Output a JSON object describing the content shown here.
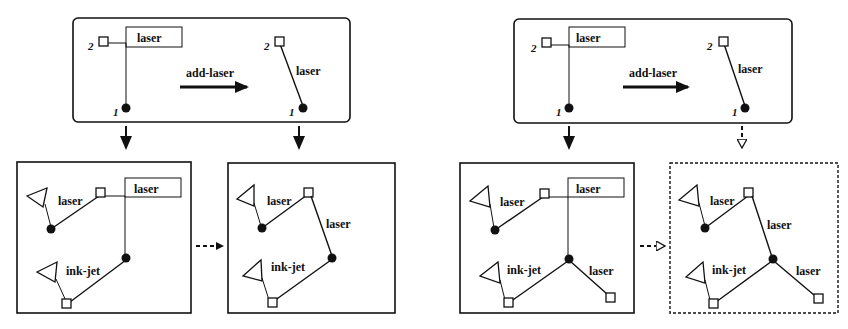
{
  "diagram": {
    "type": "graph-rewriting-rule-application",
    "panels": [
      {
        "id": "rule-left",
        "kind": "rule",
        "frame": "solid-rounded",
        "rule_label": "add-laser",
        "lhs": {
          "node_labels": [
            "2",
            "1"
          ],
          "edge_label": "laser",
          "edge_style": "boxed-label-with-elbow"
        },
        "rhs": {
          "node_labels": [
            "2",
            "1"
          ],
          "edge_label": "laser",
          "edge_style": "direct"
        }
      },
      {
        "id": "rule-right",
        "kind": "rule",
        "frame": "solid-rounded",
        "rule_label": "add-laser",
        "lhs": {
          "node_labels": [
            "2",
            "1"
          ],
          "edge_label": "laser",
          "edge_style": "boxed-label-with-elbow"
        },
        "rhs": {
          "node_labels": [
            "2",
            "1"
          ],
          "edge_label": "laser",
          "edge_style": "direct"
        }
      },
      {
        "id": "graph-1",
        "kind": "host-graph",
        "frame": "solid",
        "edge_labels": [
          "laser",
          "laser",
          "ink-jet"
        ]
      },
      {
        "id": "graph-2",
        "kind": "host-graph",
        "frame": "solid",
        "edge_labels": [
          "laser",
          "laser",
          "ink-jet"
        ]
      },
      {
        "id": "graph-3",
        "kind": "host-graph",
        "frame": "solid",
        "edge_labels": [
          "laser",
          "laser",
          "ink-jet",
          "laser"
        ]
      },
      {
        "id": "graph-4",
        "kind": "host-graph",
        "frame": "dashed",
        "edge_labels": [
          "laser",
          "laser",
          "ink-jet",
          "laser"
        ]
      }
    ],
    "arrows": [
      {
        "from": "rule-left",
        "to": "graph-1",
        "style": "solid"
      },
      {
        "from": "rule-left",
        "to": "graph-2",
        "style": "solid"
      },
      {
        "from": "graph-1",
        "to": "graph-2",
        "style": "dashed"
      },
      {
        "from": "rule-right",
        "to": "graph-3",
        "style": "solid"
      },
      {
        "from": "rule-right",
        "to": "graph-4",
        "style": "dashed"
      },
      {
        "from": "graph-3",
        "to": "graph-4",
        "style": "dashed"
      }
    ]
  },
  "labels": {
    "rule": "add-laser",
    "laser": "laser",
    "inkjet": "ink-jet",
    "n1": "1",
    "n2": "2"
  }
}
